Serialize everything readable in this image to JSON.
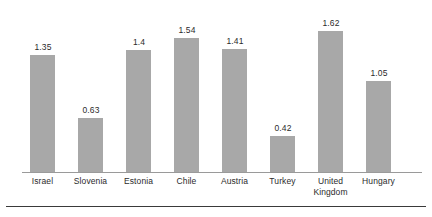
{
  "chart_data": {
    "type": "bar",
    "title": "",
    "subtitle": "",
    "xlabel": "",
    "ylabel": "",
    "categories": [
      "Israel",
      "Slovenia",
      "Estonia",
      "Chile",
      "Austria",
      "Turkey",
      "United Kingdom",
      "Hungary"
    ],
    "values": [
      1.35,
      0.63,
      1.4,
      1.54,
      1.41,
      0.42,
      1.62,
      1.05
    ],
    "data_labels": [
      "1.35",
      "0.63",
      "1.4",
      "1.54",
      "1.41",
      "0.42",
      "1.62",
      "1.05"
    ],
    "ylim": [
      0,
      1.62
    ],
    "grid": false,
    "legend": null,
    "legend_position": "none",
    "bar_color": "#a8a8a8",
    "axis_color": "#9a9a9a",
    "rule_color": "#3a3a3a",
    "label_color": "#2b2b2b"
  }
}
